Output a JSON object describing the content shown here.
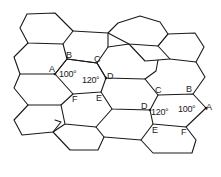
{
  "figure": {
    "line_color": "#1a1a1a",
    "background": "#ffffff"
  },
  "cell_left": {
    "vertices": {
      "A": "A",
      "B": "B",
      "C": "C",
      "D": "D",
      "E": "E",
      "F": "F"
    },
    "angle_at_A": "100°",
    "angle_at_D": "120°"
  },
  "cell_right": {
    "vertices": {
      "A": "A",
      "B": "B",
      "C": "C",
      "D": "D",
      "E": "E",
      "F": "F"
    },
    "angle_at_D": "120°",
    "angle_at_A": "100°"
  }
}
